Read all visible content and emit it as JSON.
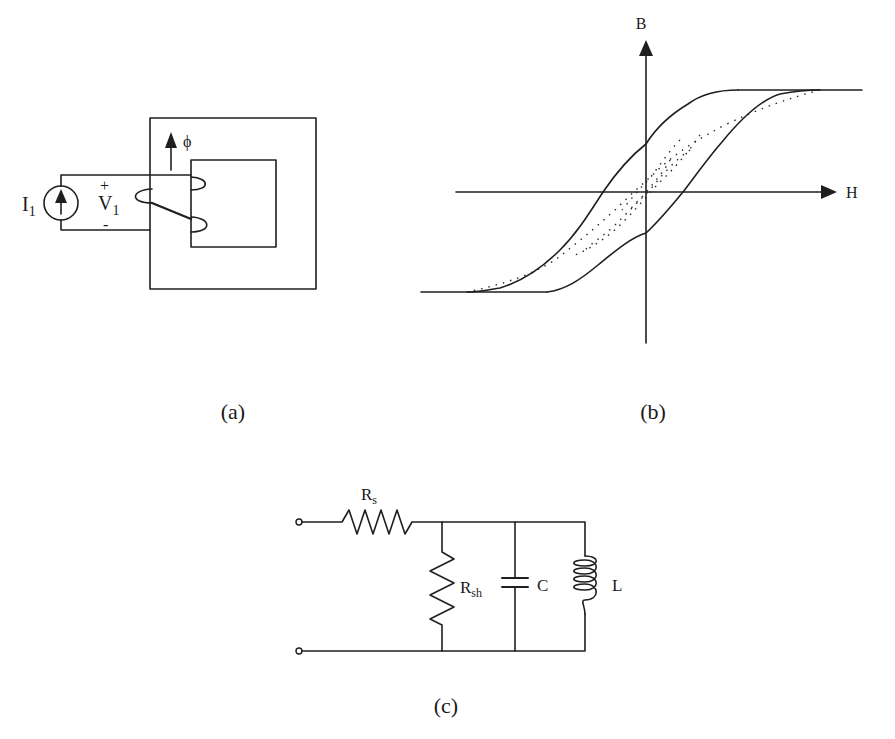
{
  "figure": {
    "panels": [
      {
        "id": "a",
        "caption": "(a)",
        "description": "Current source driving a coil wound on a square magnetic core",
        "labels": {
          "source": "I",
          "source_sub": "1",
          "voltage": "V",
          "voltage_sub": "1",
          "plus": "+",
          "minus": "-",
          "flux": "ϕ"
        }
      },
      {
        "id": "b",
        "caption": "(b)",
        "description": "B-H hysteresis loop with saturation and minor loops (dotted)",
        "labels": {
          "y_axis": "B",
          "x_axis": "H"
        }
      },
      {
        "id": "c",
        "caption": "(c)",
        "description": "Equivalent circuit: series resistance followed by parallel shunt resistance, capacitance and inductance",
        "labels": {
          "series_resistor": "R",
          "series_resistor_sub": "s",
          "shunt_resistor": "R",
          "shunt_resistor_sub": "sh",
          "capacitor": "C",
          "inductor": "L"
        }
      }
    ]
  },
  "colors": {
    "ink": "#1f1f1f",
    "background": "#ffffff"
  }
}
